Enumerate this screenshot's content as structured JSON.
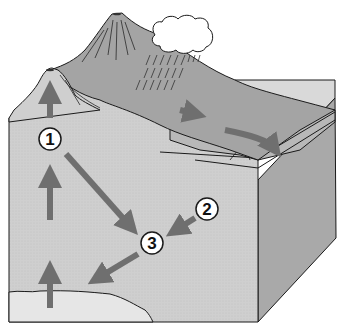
{
  "diagram": {
    "type": "rock-cycle block diagram",
    "colors": {
      "background": "#ffffff",
      "block_front": "#cfcfcf",
      "block_side": "#a9a9a9",
      "block_top": "#bdbdbd",
      "mountain": "#a4a4a4",
      "bedrock_light": "#e6e6e6",
      "arrow": "#6f6f6f",
      "outline": "#1a1a1a",
      "cloud": "#ffffff"
    },
    "labels": [
      {
        "id": "1",
        "text": "1",
        "x": 50,
        "y": 139
      },
      {
        "id": "2",
        "text": "2",
        "x": 207,
        "y": 209
      },
      {
        "id": "3",
        "text": "3",
        "x": 152,
        "y": 243
      }
    ],
    "arrows": [
      {
        "from": "magma",
        "to": "1",
        "direction": "up"
      },
      {
        "from": "1",
        "to": "volcano-peak",
        "direction": "up"
      },
      {
        "from": "1",
        "to": "3",
        "direction": "down-right"
      },
      {
        "from": "2",
        "to": "3",
        "direction": "down-left"
      },
      {
        "from": "3",
        "to": "bottom-layer",
        "direction": "down-left"
      },
      {
        "from": "slope",
        "to": "sediment",
        "direction": "right"
      },
      {
        "from": "sediment",
        "to": "sea-floor",
        "direction": "curved-down"
      }
    ],
    "features": [
      "volcano",
      "mountain",
      "cloud",
      "rain",
      "sediment layers",
      "crustal block",
      "magma layer"
    ]
  }
}
